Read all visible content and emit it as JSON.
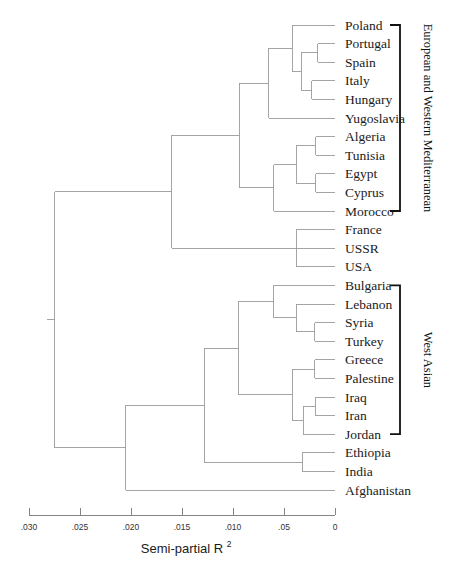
{
  "figure": {
    "type": "dendrogram",
    "leaf_labels": [
      "Poland",
      "Portugal",
      "Spain",
      "Italy",
      "Hungary",
      "Yugoslavia",
      "Algeria",
      "Tunisia",
      "Egypt",
      "Cyprus",
      "Morocco",
      "France",
      "USSR",
      "USA",
      "Bulgaria",
      "Lebanon",
      "Syria",
      "Turkey",
      "Greece",
      "Palestine",
      "Iraq",
      "Iran",
      "Jordan",
      "Ethiopia",
      "India",
      "Afghanistan"
    ],
    "group_brackets": [
      {
        "label": "European and Western Mediterranean",
        "first_leaf": "Poland",
        "last_leaf": "Morocco"
      },
      {
        "label": "West Asian",
        "first_leaf": "Bulgaria",
        "last_leaf": "Jordan"
      }
    ]
  },
  "chart_data": {
    "type": "dendrogram",
    "title": "",
    "xlabel": "Semi-partial R",
    "xlabel_superscript": "2",
    "ylabel": "",
    "grid": false,
    "legend": "none",
    "axis_direction": "reversed",
    "xlim": [
      0.03,
      0
    ],
    "xticks": [
      0.03,
      0.025,
      0.02,
      0.015,
      0.01,
      0.005,
      0
    ],
    "xticklabels": [
      ".030",
      ".025",
      ".020",
      ".015",
      ".010",
      ".05",
      "0"
    ],
    "leaves": [
      "Poland",
      "Portugal",
      "Spain",
      "Italy",
      "Hungary",
      "Yugoslavia",
      "Algeria",
      "Tunisia",
      "Egypt",
      "Cyprus",
      "Morocco",
      "France",
      "USSR",
      "USA",
      "Bulgaria",
      "Lebanon",
      "Syria",
      "Turkey",
      "Greece",
      "Palestine",
      "Iraq",
      "Iran",
      "Jordan",
      "Ethiopia",
      "India",
      "Afghanistan"
    ],
    "merges": [
      {
        "id": "m1",
        "children": [
          "Portugal",
          "Spain"
        ],
        "height": 0.0017
      },
      {
        "id": "m2",
        "children": [
          "Italy",
          "Hungary"
        ],
        "height": 0.0023
      },
      {
        "id": "m3",
        "children": [
          "m1",
          "m2"
        ],
        "height": 0.0033
      },
      {
        "id": "m4",
        "children": [
          "Poland",
          "m3"
        ],
        "height": 0.0042
      },
      {
        "id": "m5",
        "children": [
          "m4",
          "Yugoslavia"
        ],
        "height": 0.0065
      },
      {
        "id": "m6",
        "children": [
          "Algeria",
          "Tunisia"
        ],
        "height": 0.0019
      },
      {
        "id": "m7",
        "children": [
          "Egypt",
          "Cyprus"
        ],
        "height": 0.0019
      },
      {
        "id": "m8",
        "children": [
          "m6",
          "m7"
        ],
        "height": 0.0038
      },
      {
        "id": "m9",
        "children": [
          "m8",
          "Morocco"
        ],
        "height": 0.006
      },
      {
        "id": "m10",
        "children": [
          "m5",
          "m9"
        ],
        "height": 0.0094
      },
      {
        "id": "m11",
        "children": [
          "France",
          "USSR",
          "USA"
        ],
        "height": 0.0038
      },
      {
        "id": "m12",
        "children": [
          "m10",
          "m11"
        ],
        "height": 0.016
      },
      {
        "id": "m13",
        "children": [
          "Syria",
          "Turkey"
        ],
        "height": 0.002
      },
      {
        "id": "m14",
        "children": [
          "Lebanon",
          "m13"
        ],
        "height": 0.0038
      },
      {
        "id": "m15",
        "children": [
          "Bulgaria",
          "m14"
        ],
        "height": 0.006
      },
      {
        "id": "m16",
        "children": [
          "Greece",
          "Palestine"
        ],
        "height": 0.002
      },
      {
        "id": "m17",
        "children": [
          "Iraq",
          "Iran"
        ],
        "height": 0.0019
      },
      {
        "id": "m18",
        "children": [
          "m17",
          "Jordan"
        ],
        "height": 0.0031
      },
      {
        "id": "m19",
        "children": [
          "m16",
          "m18"
        ],
        "height": 0.0042
      },
      {
        "id": "m20",
        "children": [
          "m15",
          "m19"
        ],
        "height": 0.0095
      },
      {
        "id": "m21",
        "children": [
          "Ethiopia",
          "India"
        ],
        "height": 0.0032
      },
      {
        "id": "m22",
        "children": [
          "m20",
          "m21"
        ],
        "height": 0.0128
      },
      {
        "id": "m23",
        "children": [
          "m22",
          "Afghanistan"
        ],
        "height": 0.0205
      },
      {
        "id": "m24",
        "children": [
          "m12",
          "m23"
        ],
        "height": 0.0275
      }
    ],
    "root": "m24"
  },
  "geometry": {
    "plot_left_px": 29,
    "plot_right_px": 335,
    "first_leaf_y_px": 25,
    "leaf_spacing_px": 18.6,
    "label_offset_px": 10,
    "axis_y_px": 515,
    "tick_len_px": 7,
    "tick_label_y_px": 530,
    "axis_title_y_px": 553,
    "bracket_x_px": 400,
    "bracket_arm_px": 10,
    "bracket_text_x_px": 424
  }
}
